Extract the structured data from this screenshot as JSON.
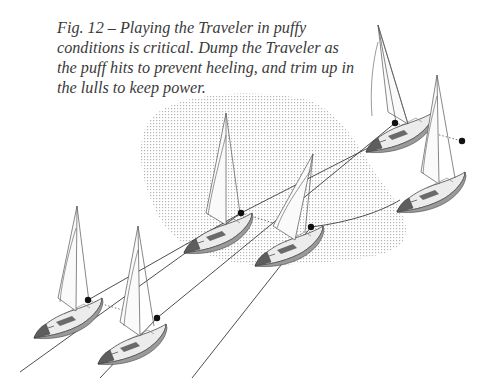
{
  "figure": {
    "number": "Fig. 12",
    "caption_lines": [
      "Fig. 12 – Playing the Traveler in puffy",
      "conditions is critical. Dump the Traveler as",
      "the puff hits to prevent heeling, and trim up in",
      "the lulls to keep power."
    ]
  },
  "colors": {
    "puff_stipple": "#c8c8c8",
    "line": "#3a3a3a",
    "hull_light": "#e6e6e6",
    "hull_dark": "#5a5a5a",
    "marker": "#111111"
  },
  "elements": {
    "puff_area": "stippled gust region",
    "boats": [
      {
        "id": "boat-a",
        "position": "far-left",
        "state": "upright"
      },
      {
        "id": "boat-b",
        "position": "front-lower",
        "state": "upright"
      },
      {
        "id": "boat-c",
        "position": "center-left in puff",
        "state": "upright"
      },
      {
        "id": "boat-d",
        "position": "center in puff",
        "state": "heeled"
      },
      {
        "id": "boat-e",
        "position": "top-right",
        "state": "upright"
      },
      {
        "id": "boat-f",
        "position": "right",
        "state": "upright"
      }
    ]
  }
}
